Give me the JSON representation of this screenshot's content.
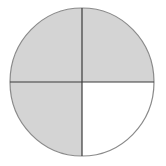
{
  "diagram": {
    "type": "fraction-circle",
    "total_parts": 4,
    "shaded_parts": 3,
    "shaded_quadrants": [
      "top-left",
      "top-right",
      "bottom-left"
    ],
    "unshaded_quadrants": [
      "bottom-right"
    ],
    "colors": {
      "shaded": "#d4d4d4",
      "unshaded": "#ffffff",
      "outline": "#8a8a8a",
      "divider": "#3a3a3a"
    }
  }
}
